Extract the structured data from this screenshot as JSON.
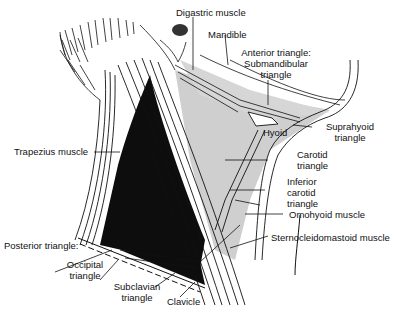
{
  "figure": {
    "colors": {
      "background": "#ffffff",
      "line": "#111111",
      "shade_anterior": "#cfcfcf",
      "dark_posterior": "#0d0d0d"
    }
  },
  "labels": {
    "digastric": "Digastric muscle",
    "mandible": "Mandible",
    "anterior_line1": "Anterior triangle:",
    "anterior_line2": "Submandibular",
    "anterior_line3": "triangle",
    "hyoid": "Hyoid",
    "suprahyoid_line1": "Suprahyoid",
    "suprahyoid_line2": "triangle",
    "trapezius": "Trapezius muscle",
    "carotid_line1": "Carotid",
    "carotid_line2": "triangle",
    "inferior_line1": "Inferior",
    "inferior_line2": "carotid",
    "inferior_line3": "triangle",
    "omohyoid": "Omohyoid muscle",
    "scm": "Sternocleidomastoid muscle",
    "posterior": "Posterior triangle:",
    "occipital_line1": "Occipital",
    "occipital_line2": "triangle",
    "subclavian_line1": "Subclavian",
    "subclavian_line2": "triangle",
    "clavicle": "Clavicle"
  }
}
